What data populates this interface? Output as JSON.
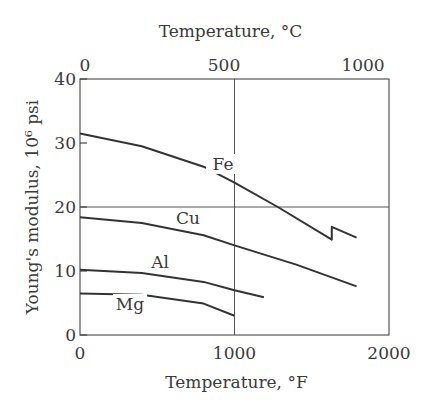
{
  "chart_data": {
    "type": "line",
    "title": "",
    "xlabel": "Temperature, °F",
    "x2label": "Temperature, °C",
    "ylabel": "Young's modulus, 10⁶ psi",
    "xlim": [
      0,
      2000
    ],
    "ylim": [
      0,
      40
    ],
    "x_ticks": [
      "0",
      "1000",
      "2000"
    ],
    "x2_ticks": [
      "0",
      "500",
      "1000"
    ],
    "y_ticks": [
      "0",
      "10",
      "20",
      "30",
      "40"
    ],
    "grid": {
      "x": [
        1000
      ],
      "y": [
        20
      ]
    },
    "legend": "inline labels",
    "series": [
      {
        "name": "Fe",
        "x": [
          0,
          400,
          800,
          1000,
          1280,
          1630,
          1630,
          1790
        ],
        "y": [
          31.5,
          29.5,
          26.3,
          23.8,
          20.0,
          14.9,
          16.9,
          15.2
        ]
      },
      {
        "name": "Cu",
        "x": [
          0,
          400,
          800,
          1000,
          1400,
          1790
        ],
        "y": [
          18.4,
          17.5,
          15.6,
          14.0,
          11.0,
          7.6
        ]
      },
      {
        "name": "Al",
        "x": [
          0,
          400,
          800,
          1000,
          1190
        ],
        "y": [
          10.2,
          9.7,
          8.3,
          7.0,
          5.9
        ]
      },
      {
        "name": "Mg",
        "x": [
          0,
          400,
          800,
          1000
        ],
        "y": [
          6.5,
          6.3,
          4.9,
          3.0
        ]
      }
    ]
  }
}
